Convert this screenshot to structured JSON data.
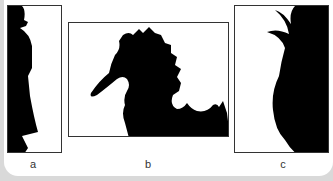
{
  "figure": {
    "panels": [
      {
        "id": "a",
        "label": "a",
        "subject": "man-in-hat-silhouette"
      },
      {
        "id": "b",
        "label": "b",
        "subject": "seahorse-silhouette"
      },
      {
        "id": "c",
        "label": "c",
        "subject": "pineapple-silhouette"
      }
    ],
    "colors": {
      "silhouette": "#000000",
      "background": "#ffffff",
      "border": "#333333",
      "page": "#d9d9d9"
    }
  }
}
